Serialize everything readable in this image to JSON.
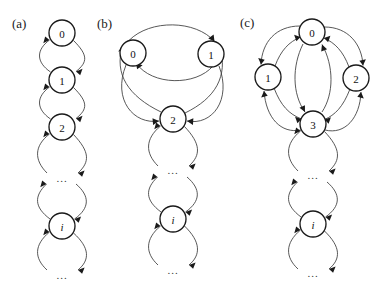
{
  "figure": {
    "type": "state-transition-diagram-set",
    "background": "#ffffff",
    "stroke_color": "#3a3a3a",
    "node_stroke_color": "#1a1a1a",
    "node_fill": "#ffffff",
    "width": 391,
    "height": 290
  },
  "panels": [
    {
      "id": "a",
      "label": "(a)",
      "label_x": 12,
      "label_y": 16,
      "description": "birth-death chain",
      "node_radius": 13,
      "nodes": [
        {
          "name": "0",
          "x": 62,
          "y": 33,
          "italic": false
        },
        {
          "name": "1",
          "x": 62,
          "y": 80,
          "italic": false
        },
        {
          "name": "2",
          "x": 62,
          "y": 127,
          "italic": false
        },
        {
          "name": "...",
          "x": 62,
          "y": 178,
          "italic": false,
          "is_ellipsis": true
        },
        {
          "name": "i",
          "x": 62,
          "y": 226,
          "italic": true
        },
        {
          "name": "...",
          "x": 62,
          "y": 275,
          "italic": false,
          "is_ellipsis": true
        }
      ],
      "edges": [
        {
          "from": "0",
          "to": "1",
          "style": "curve-right"
        },
        {
          "from": "1",
          "to": "0",
          "style": "curve-left"
        },
        {
          "from": "1",
          "to": "2",
          "style": "curve-right"
        },
        {
          "from": "2",
          "to": "1",
          "style": "curve-left"
        },
        {
          "from": "2",
          "to": "...",
          "style": "curve-right"
        },
        {
          "from": "...",
          "to": "2",
          "style": "curve-left"
        },
        {
          "from": "...",
          "to": "i",
          "style": "curve-right"
        },
        {
          "from": "i",
          "to": "...",
          "style": "curve-left"
        },
        {
          "from": "i",
          "to": "...",
          "style": "curve-right"
        },
        {
          "from": "...",
          "to": "i",
          "style": "curve-left"
        }
      ]
    },
    {
      "id": "b",
      "label": "(b)",
      "label_x": 97,
      "label_y": 16,
      "description": "two-source chain merging into birth-death tail",
      "node_radius": 13,
      "nodes": [
        {
          "name": "0",
          "x": 133,
          "y": 53,
          "italic": false
        },
        {
          "name": "1",
          "x": 211,
          "y": 54,
          "italic": false
        },
        {
          "name": "2",
          "x": 173,
          "y": 119,
          "italic": false
        },
        {
          "name": "...",
          "x": 173,
          "y": 170,
          "italic": false,
          "is_ellipsis": true
        },
        {
          "name": "i",
          "x": 173,
          "y": 219,
          "italic": true
        },
        {
          "name": "...",
          "x": 173,
          "y": 270,
          "italic": false,
          "is_ellipsis": true
        }
      ],
      "edges": [
        {
          "from": "0",
          "to": "1",
          "style": "arc-over"
        },
        {
          "from": "1",
          "to": "0",
          "style": "arc-under"
        },
        {
          "from": "0",
          "to": "2",
          "style": "curve-down-right"
        },
        {
          "from": "2",
          "to": "0",
          "style": "curve-up-left"
        },
        {
          "from": "1",
          "to": "2",
          "style": "curve-down-left"
        },
        {
          "from": "2",
          "to": "1",
          "style": "curve-up-right"
        },
        {
          "from": "2",
          "to": "...",
          "style": "curve-right"
        },
        {
          "from": "...",
          "to": "2",
          "style": "curve-left"
        },
        {
          "from": "...",
          "to": "i",
          "style": "curve-right"
        },
        {
          "from": "i",
          "to": "...",
          "style": "curve-left"
        },
        {
          "from": "i",
          "to": "...",
          "style": "curve-right"
        },
        {
          "from": "...",
          "to": "i",
          "style": "curve-left"
        }
      ]
    },
    {
      "id": "c",
      "label": "(c)",
      "label_x": 240,
      "label_y": 15,
      "description": "three-source diamond merging into birth-death tail",
      "node_radius": 13,
      "nodes": [
        {
          "name": "0",
          "x": 312,
          "y": 32,
          "italic": false
        },
        {
          "name": "1",
          "x": 268,
          "y": 77,
          "italic": false
        },
        {
          "name": "2",
          "x": 356,
          "y": 78,
          "italic": false
        },
        {
          "name": "3",
          "x": 313,
          "y": 124,
          "italic": false
        },
        {
          "name": "...",
          "x": 313,
          "y": 175,
          "italic": false,
          "is_ellipsis": true
        },
        {
          "name": "i",
          "x": 313,
          "y": 224,
          "italic": true
        },
        {
          "name": "...",
          "x": 313,
          "y": 273,
          "italic": false,
          "is_ellipsis": true
        }
      ],
      "edges": [
        {
          "from": "0",
          "to": "1",
          "style": "curve-left-down"
        },
        {
          "from": "1",
          "to": "0",
          "style": "curve-left-up"
        },
        {
          "from": "0",
          "to": "2",
          "style": "curve-right-down"
        },
        {
          "from": "2",
          "to": "0",
          "style": "curve-right-up"
        },
        {
          "from": "0",
          "to": "3",
          "style": "curve-center-down"
        },
        {
          "from": "3",
          "to": "0",
          "style": "curve-center-up"
        },
        {
          "from": "1",
          "to": "3",
          "style": "curve-left-down2"
        },
        {
          "from": "3",
          "to": "1",
          "style": "curve-left-up2"
        },
        {
          "from": "2",
          "to": "3",
          "style": "curve-right-down2"
        },
        {
          "from": "3",
          "to": "2",
          "style": "curve-right-up2"
        },
        {
          "from": "3",
          "to": "...",
          "style": "curve-right"
        },
        {
          "from": "...",
          "to": "3",
          "style": "curve-left"
        },
        {
          "from": "...",
          "to": "i",
          "style": "curve-right"
        },
        {
          "from": "i",
          "to": "...",
          "style": "curve-left"
        },
        {
          "from": "i",
          "to": "...",
          "style": "curve-right"
        },
        {
          "from": "...",
          "to": "i",
          "style": "curve-left"
        }
      ]
    }
  ]
}
